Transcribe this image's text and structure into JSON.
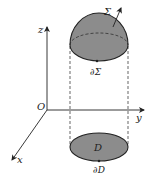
{
  "diagram": {
    "colors": {
      "fill": "#8c8c8c",
      "stroke": "#222222",
      "background": "#ffffff"
    },
    "axes": {
      "origin_label": "O",
      "x_label": "x",
      "y_label": "y",
      "z_label": "z"
    },
    "surface": {
      "label": "Σ",
      "boundary_label": "∂Σ",
      "has_normal_arrow": true
    },
    "region": {
      "label": "D",
      "boundary_label": "∂D"
    }
  }
}
